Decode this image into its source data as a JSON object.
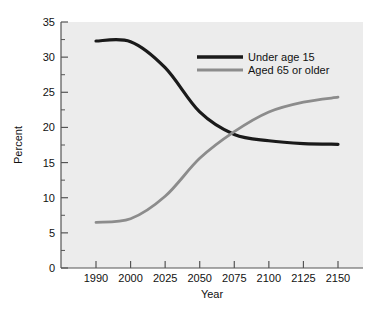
{
  "chart_data": {
    "type": "line",
    "title": "",
    "xlabel": "Year",
    "ylabel": "Percent",
    "grid": false,
    "legend_position": "top-right",
    "ylim": [
      0,
      35
    ],
    "yticks": [
      0,
      5,
      10,
      15,
      20,
      25,
      30,
      35
    ],
    "ytick_labels": [
      "0",
      "5",
      "10",
      "15",
      "20",
      "25",
      "30",
      "35"
    ],
    "y_minor_ticks": [
      2.5,
      7.5,
      12.5,
      17.5,
      22.5,
      27.5,
      32.5
    ],
    "categories": [
      "1990",
      "2000",
      "2025",
      "2050",
      "2075",
      "2100",
      "2125",
      "2150"
    ],
    "x_axis_note": "categories equally spaced",
    "series": [
      {
        "name": "Under age 15",
        "color": "#1a1a1a",
        "values": [
          32.3,
          32.2,
          28.5,
          22.2,
          19.0,
          18.1,
          17.7,
          17.6
        ]
      },
      {
        "name": "Aged 65 or older",
        "color": "#8c8c8c",
        "values": [
          6.5,
          7.0,
          10.2,
          15.6,
          19.4,
          22.2,
          23.6,
          24.3
        ]
      }
    ],
    "annotations": [
      {
        "text": "curves cross near 2075 at about 19 percent"
      }
    ]
  },
  "axes": {
    "x_title": "Year",
    "y_title": "Percent",
    "x_tick_labels": [
      "1990",
      "2000",
      "2025",
      "2050",
      "2075",
      "2100",
      "2125",
      "2150"
    ],
    "y_tick_labels": [
      "0",
      "5",
      "10",
      "15",
      "20",
      "25",
      "30",
      "35"
    ]
  },
  "legend": {
    "entries": [
      {
        "label": "Under age 15",
        "color": "#1a1a1a"
      },
      {
        "label": "Aged 65 or older",
        "color": "#8c8c8c"
      }
    ]
  },
  "colors": {
    "page_background": "#ffffff",
    "plot_background": "#ececec",
    "axis": "#555555",
    "series_black": "#1a1a1a",
    "series_gray": "#8c8c8c",
    "text": "#111111"
  }
}
